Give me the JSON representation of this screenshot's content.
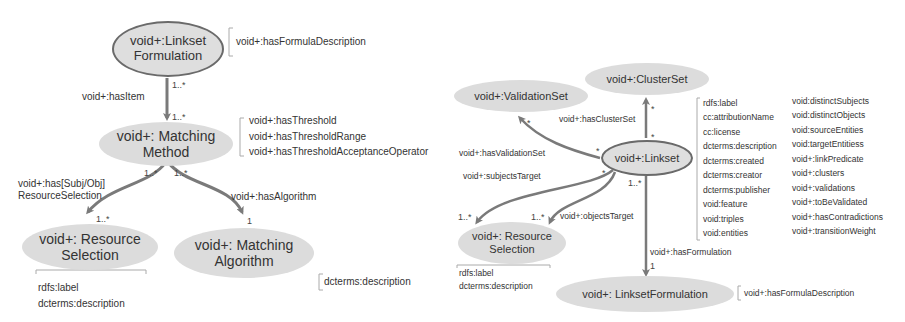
{
  "left_diagram": {
    "nodes": {
      "linkset_formulation": "void+:Linkset Formulation",
      "linkset_formulation_l1": "void+:Linkset",
      "linkset_formulation_l2": "Formulation",
      "matching_method_l1": "void+: Matching",
      "matching_method_l2": "Method",
      "resource_selection_l1": "void+: Resource",
      "resource_selection_l2": "Selection",
      "matching_algorithm_l1": "void+: Matching",
      "matching_algorithm_l2": "Algorithm"
    },
    "properties": {
      "formulation": [
        "void+:hasFormulaDescription"
      ],
      "method": [
        "void+:hasThreshold",
        "void+:hasThresholdRange",
        "void+:hasThresholdAcceptanceOperator"
      ],
      "resource_selection": [
        "rdfs:label",
        "dcterms:description"
      ],
      "algorithm": [
        "dcterms:description"
      ]
    },
    "edges": {
      "has_item": "void+:hasItem",
      "has_resource_selection_l1": "void+:has[Subj/Obj]",
      "has_resource_selection_l2": "ResourceSelection",
      "has_algorithm": "void+:hasAlgorithm"
    },
    "cardinalities": {
      "has_item_src": "1..*",
      "has_item_dst": "1..*",
      "rs_src": "1..*",
      "alg_src": "1..*",
      "rs_dst": "1..*",
      "alg_dst": "1"
    }
  },
  "right_diagram": {
    "nodes": {
      "validation_set": "void+:ValidationSet",
      "cluster_set": "void+:ClusterSet",
      "linkset": "void+:Linkset",
      "resource_selection_l1": "void+: Resource",
      "resource_selection_l2": "Selection",
      "linkset_formulation": "void+: LinksetFormulation"
    },
    "properties": {
      "linkset_col1": [
        "rdfs:label",
        "cc:attributionName",
        "cc:license",
        "dcterms:description",
        "dcterms:created",
        "dcterms:creator",
        "dcterms:publisher",
        "void:feature",
        "void:triples",
        "void:entities"
      ],
      "linkset_col2": [
        "void:distinctSubjects",
        "void:distinctObjects",
        "void:sourceEntities",
        "void:targetEntitiess",
        "void+:linkPredicate",
        "void+:clusters",
        "void+:validations",
        "void+:toBeValidated",
        "void+:hasContradictions",
        "void+:transitionWeight"
      ],
      "resource_selection": [
        "rdfs:label",
        "dcterms:description"
      ],
      "formulation": [
        "void+:hasFormulaDescription"
      ]
    },
    "edges": {
      "has_validation_set": "void+:hasValidationSet",
      "has_cluster_set": "void+:hasClusterSet",
      "subjects_target": "void+:subjectsTarget",
      "objects_target": "void+:objectsTarget",
      "has_formulation": "void+:hasFormulation"
    },
    "cardinalities": {
      "star": "*",
      "one_many": "1..*",
      "one": "1"
    }
  }
}
